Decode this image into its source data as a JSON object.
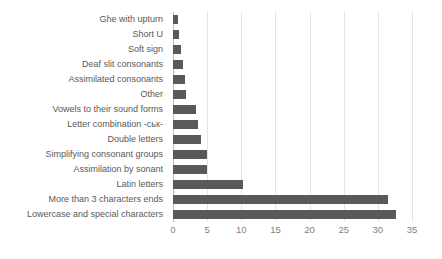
{
  "chart_data": {
    "type": "bar",
    "orientation": "horizontal",
    "title": "",
    "xlabel": "",
    "ylabel": "",
    "xlim": [
      0,
      35
    ],
    "xticks": [
      "0",
      "5",
      "10",
      "15",
      "20",
      "25",
      "30",
      "35"
    ],
    "grid": true,
    "legend": false,
    "bar_color": "#595959",
    "gridline_color": "#e4e4e4",
    "axis_color": "#bfbfbf",
    "label_color": "#595959",
    "tick_color": "#7f7f7f",
    "categories": [
      "Ghe with upturn",
      "Short U",
      "Soft sign",
      "Deaf slit consonants",
      "Assimilated consonants",
      "Other",
      "Vowels to their sound forms",
      "Letter combination -ськ-",
      "Double letters",
      "Simplifying consonant groups",
      "Assimilation by sonant",
      "Latin letters",
      "More than 3 characters ends",
      "Lowercase and special characters"
    ],
    "values": [
      0.7,
      0.9,
      1.2,
      1.5,
      1.7,
      1.9,
      3.3,
      3.6,
      4.1,
      5.0,
      5.0,
      10.2,
      31.5,
      32.7
    ]
  }
}
